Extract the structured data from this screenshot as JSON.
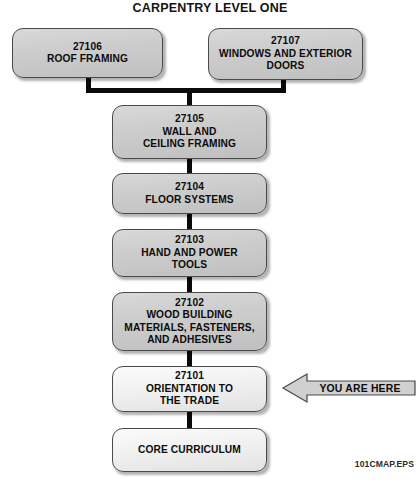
{
  "title": "CARPENTRY LEVEL ONE",
  "footer": "101CMAP.EPS",
  "colors": {
    "box_fill": "#cdcdcd",
    "box_fill_light": "#f2f2f2",
    "box_border": "#4a4a4a",
    "connector": "#0a0a0a",
    "text": "#0c0c0c",
    "callout_fill": "#d0d0d0"
  },
  "callout": {
    "label": "YOU ARE HERE",
    "points_to": "27101",
    "direction": "left"
  },
  "nodes": [
    {
      "id": "27106",
      "number": "27106",
      "lines": [
        "ROOF FRAMING"
      ],
      "style": "gray",
      "row": "top-left"
    },
    {
      "id": "27107",
      "number": "27107",
      "lines": [
        "WINDOWS AND EXTERIOR",
        "DOORS"
      ],
      "style": "gray",
      "row": "top-right"
    },
    {
      "id": "27105",
      "number": "27105",
      "lines": [
        "WALL AND",
        "CEILING FRAMING"
      ],
      "style": "gray",
      "row": "main"
    },
    {
      "id": "27104",
      "number": "27104",
      "lines": [
        "FLOOR SYSTEMS"
      ],
      "style": "gray",
      "row": "main"
    },
    {
      "id": "27103",
      "number": "27103",
      "lines": [
        "HAND AND POWER",
        "TOOLS"
      ],
      "style": "gray",
      "row": "main"
    },
    {
      "id": "27102",
      "number": "27102",
      "lines": [
        "WOOD BUILDING",
        "MATERIALS, FASTENERS,",
        "AND ADHESIVES"
      ],
      "style": "gray",
      "row": "main"
    },
    {
      "id": "27101",
      "number": "27101",
      "lines": [
        "ORIENTATION TO",
        "THE TRADE"
      ],
      "style": "light",
      "row": "main"
    },
    {
      "id": "core",
      "number": "",
      "lines": [
        "CORE CURRICULUM"
      ],
      "style": "light",
      "row": "bottom"
    }
  ]
}
